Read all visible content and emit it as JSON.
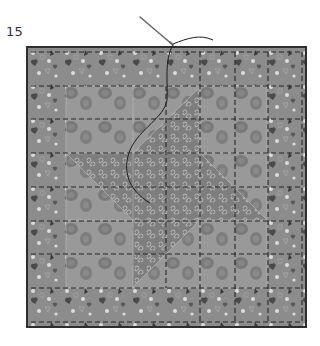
{
  "step": {
    "number": "15"
  },
  "illustration": {
    "subject": "quilt-block-friendship-star-with-needle-and-thread",
    "block": {
      "x": 27,
      "y": 47,
      "width": 279,
      "height": 280,
      "grid": 8
    },
    "colors": {
      "border_print": "#8a8a8a",
      "background_print": "#9a9a9a",
      "star_print": "#7d7d7d",
      "blob": "#6e6e6e",
      "outline": "#2e2e2e",
      "dash": "#262626",
      "motif_light": "#d8d8d8",
      "motif_dark": "#3a3a3a",
      "thread": "#1c1c1c",
      "needle": "#6a6a6a"
    },
    "tools": [
      "needle-icon",
      "thread-icon"
    ]
  }
}
